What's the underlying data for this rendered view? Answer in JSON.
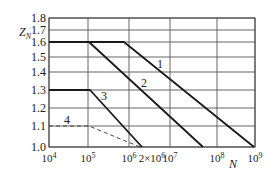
{
  "chart_data": {
    "type": "line",
    "title": "",
    "xlabel": "N",
    "ylabel": "Z_N",
    "x_scale": "log-like (non-uniform grid)",
    "x_tick_labels": [
      "10^4",
      "10^5",
      "10^6",
      "2×10^6",
      "10^7",
      "10^8",
      "10^9"
    ],
    "y_tick_labels": [
      "1.0",
      "1.1",
      "1.2",
      "1.3",
      "1.4",
      "1.5",
      "1.6",
      "1.7",
      "1.8"
    ],
    "ylim": [
      1.0,
      1.8
    ],
    "xlim": [
      10000,
      1000000000
    ],
    "grid": true,
    "legend": "inline curve labels",
    "series": [
      {
        "name": "1",
        "style": "solid",
        "points": [
          [
            10000,
            1.6
          ],
          [
            1500000,
            1.6
          ],
          [
            1000000000,
            1.0
          ]
        ]
      },
      {
        "name": "2",
        "style": "solid",
        "points": [
          [
            10000,
            1.6
          ],
          [
            100000,
            1.6
          ],
          [
            50000000,
            1.0
          ]
        ]
      },
      {
        "name": "3",
        "style": "solid",
        "points": [
          [
            10000,
            1.3
          ],
          [
            100000,
            1.3
          ],
          [
            2000000,
            1.0
          ]
        ]
      },
      {
        "name": "4",
        "style": "dashed",
        "points": [
          [
            10000,
            1.1
          ],
          [
            100000,
            1.1
          ],
          [
            2000000,
            1.0
          ]
        ]
      }
    ]
  },
  "axis": {
    "y_label_main": "Z",
    "y_label_sub": "N",
    "x_label": "N",
    "y_ticks": [
      {
        "label": "1.8",
        "y": 18
      },
      {
        "label": "1.7",
        "y": 30
      },
      {
        "label": "1.6",
        "y": 42
      },
      {
        "label": "1.5",
        "y": 57
      },
      {
        "label": "1.4",
        "y": 72
      },
      {
        "label": "1.3",
        "y": 90
      },
      {
        "label": "1.2",
        "y": 108
      },
      {
        "label": "1.1",
        "y": 126
      },
      {
        "label": "1.0",
        "y": 147
      }
    ],
    "x_ticks": [
      {
        "base": "10",
        "exp": "4",
        "x": 49
      },
      {
        "base": "10",
        "exp": "5",
        "x": 88
      },
      {
        "base": "10",
        "exp": "6",
        "x": 129
      },
      {
        "base": "2×10",
        "exp": "6",
        "x": 152
      },
      {
        "base": "10",
        "exp": "7",
        "x": 170
      },
      {
        "base": "10",
        "exp": "8",
        "x": 217
      },
      {
        "base": "10",
        "exp": "9",
        "x": 255
      }
    ]
  },
  "curve_labels": [
    {
      "text": "1",
      "x": 160,
      "y": 68
    },
    {
      "text": "2",
      "x": 144,
      "y": 87
    },
    {
      "text": "3",
      "x": 104,
      "y": 100
    },
    {
      "text": "4",
      "x": 67,
      "y": 124
    }
  ]
}
